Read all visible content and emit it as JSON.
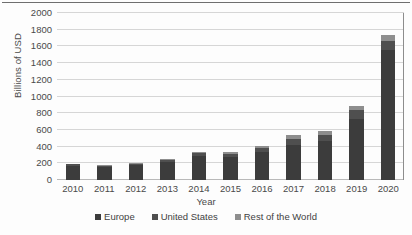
{
  "chart_data": {
    "type": "bar",
    "subtype": "stacked-bar",
    "title": "",
    "xlabel": "Year",
    "ylabel": "Billions of USD",
    "categories": [
      "2010",
      "2011",
      "2012",
      "2013",
      "2014",
      "2015",
      "2016",
      "2017",
      "2018",
      "2019",
      "2020"
    ],
    "ylim": [
      0,
      2000
    ],
    "ytick_step": 200,
    "ytick_labels": [
      "2000",
      "1800",
      "1600",
      "1400",
      "1200",
      "1000",
      "800",
      "600",
      "400",
      "200",
      "0"
    ],
    "grid": true,
    "legend_position": "bottom",
    "series": [
      {
        "name": "Europe",
        "color": "#3c3c3c",
        "values": [
          170,
          155,
          175,
          215,
          290,
          275,
          330,
          425,
          470,
          730,
          1560
        ]
      },
      {
        "name": "United States",
        "color": "#4f4f4f",
        "values": [
          18,
          18,
          22,
          28,
          35,
          40,
          55,
          70,
          75,
          105,
          110
        ]
      },
      {
        "name": "Rest of the World",
        "color": "#8e8e8e",
        "values": [
          5,
          5,
          8,
          10,
          15,
          15,
          25,
          40,
          45,
          55,
          70
        ]
      }
    ],
    "totals": [
      193,
      178,
      205,
      253,
      340,
      330,
      410,
      535,
      590,
      890,
      1740
    ]
  },
  "legend": {
    "items": [
      {
        "label": "Europe"
      },
      {
        "label": "United States"
      },
      {
        "label": "Rest of the World"
      }
    ]
  }
}
